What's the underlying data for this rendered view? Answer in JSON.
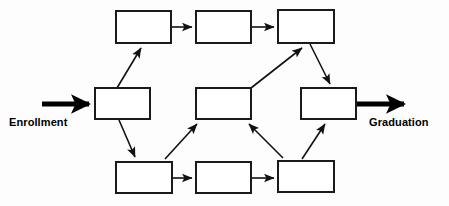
{
  "diagram": {
    "background_color": "#fdfdfd",
    "box_fill": "#ffffff",
    "box_stroke": "#1a1a1a",
    "edge_color": "#111111",
    "entry_label": "Enrollment",
    "exit_label": "Graduation",
    "nodes": [
      {
        "id": "top-1",
        "label": "",
        "x": 116,
        "y": 11,
        "w": 55,
        "h": 32
      },
      {
        "id": "top-2",
        "label": "",
        "x": 196,
        "y": 11,
        "w": 55,
        "h": 32
      },
      {
        "id": "top-3",
        "label": "",
        "x": 278,
        "y": 10,
        "w": 56,
        "h": 33
      },
      {
        "id": "mid-left",
        "label": "",
        "x": 95,
        "y": 88,
        "w": 55,
        "h": 31
      },
      {
        "id": "mid-center",
        "label": "",
        "x": 196,
        "y": 88,
        "w": 55,
        "h": 31
      },
      {
        "id": "mid-right",
        "label": "",
        "x": 301,
        "y": 88,
        "w": 55,
        "h": 31
      },
      {
        "id": "bot-1",
        "label": "",
        "x": 116,
        "y": 162,
        "w": 56,
        "h": 31
      },
      {
        "id": "bot-2",
        "label": "",
        "x": 196,
        "y": 162,
        "w": 55,
        "h": 31
      },
      {
        "id": "bot-3",
        "label": "",
        "x": 278,
        "y": 161,
        "w": 56,
        "h": 31
      }
    ],
    "edges": [
      {
        "id": "entry-to-mid-left",
        "from": "entry",
        "to": "mid-left",
        "style": "thick"
      },
      {
        "id": "mid-left-to-top-1",
        "from": "mid-left",
        "to": "top-1",
        "style": "thin"
      },
      {
        "id": "mid-left-to-bot-1",
        "from": "mid-left",
        "to": "bot-1",
        "style": "thin"
      },
      {
        "id": "top-1-to-top-2",
        "from": "top-1",
        "to": "top-2",
        "style": "thin"
      },
      {
        "id": "top-2-to-top-3",
        "from": "top-2",
        "to": "top-3",
        "style": "thin"
      },
      {
        "id": "bot-1-to-bot-2",
        "from": "bot-1",
        "to": "bot-2",
        "style": "thin"
      },
      {
        "id": "bot-2-to-bot-3",
        "from": "bot-2",
        "to": "bot-3",
        "style": "thin"
      },
      {
        "id": "bot-1-to-mid-center",
        "from": "bot-1",
        "to": "mid-center",
        "style": "thin"
      },
      {
        "id": "bot-3-to-mid-center",
        "from": "bot-3",
        "to": "mid-center",
        "style": "thin"
      },
      {
        "id": "mid-center-to-top-3",
        "from": "mid-center",
        "to": "top-3",
        "style": "thin"
      },
      {
        "id": "top-3-to-mid-right",
        "from": "top-3",
        "to": "mid-right",
        "style": "thin"
      },
      {
        "id": "bot-3-to-mid-right",
        "from": "bot-3",
        "to": "mid-right",
        "style": "thin"
      },
      {
        "id": "mid-right-to-exit",
        "from": "mid-right",
        "to": "exit",
        "style": "thick"
      }
    ]
  }
}
